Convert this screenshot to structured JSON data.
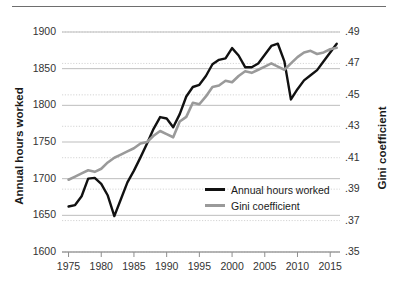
{
  "chart_data": {
    "type": "line",
    "title": "",
    "xlabel": "",
    "ylabel": "Annual hours worked",
    "y2label": "Gini coefficient",
    "x": [
      1975,
      1976,
      1977,
      1978,
      1979,
      1980,
      1981,
      1982,
      1983,
      1984,
      1985,
      1986,
      1987,
      1988,
      1989,
      1990,
      1991,
      1992,
      1993,
      1994,
      1995,
      1996,
      1997,
      1998,
      1999,
      2000,
      2001,
      2002,
      2003,
      2004,
      2005,
      2006,
      2007,
      2008,
      2009,
      2010,
      2011,
      2012,
      2013,
      2014,
      2015,
      2016
    ],
    "xlim": [
      1974,
      2016.5
    ],
    "xticks": [
      1975,
      1980,
      1985,
      1990,
      1995,
      2000,
      2005,
      2010,
      2015
    ],
    "xtick_labels": [
      "1975",
      "1980",
      "1985",
      "1990",
      "1995",
      "2000",
      "2005",
      "2010",
      "2015"
    ],
    "ylim": [
      1600,
      1900
    ],
    "yticks": [
      1600,
      1650,
      1700,
      1750,
      1800,
      1850,
      1900
    ],
    "ytick_labels": [
      "1600",
      "1650",
      "1700",
      "1750",
      "1800",
      "1850",
      "1900"
    ],
    "y2lim": [
      0.35,
      0.49
    ],
    "y2ticks": [
      0.35,
      0.37,
      0.39,
      0.41,
      0.43,
      0.45,
      0.47,
      0.49
    ],
    "y2tick_labels": [
      ".35",
      ".37",
      ".39",
      ".41",
      ".43",
      ".45",
      ".47",
      ".49"
    ],
    "grid": true,
    "legend_position": "center-right",
    "series": [
      {
        "name": "Annual hours worked",
        "axis": "left",
        "color": "#111111",
        "values": [
          1662,
          1664,
          1676,
          1700,
          1701,
          1693,
          1677,
          1649,
          1672,
          1695,
          1711,
          1729,
          1748,
          1768,
          1784,
          1782,
          1770,
          1788,
          1812,
          1825,
          1828,
          1840,
          1856,
          1862,
          1864,
          1878,
          1868,
          1852,
          1852,
          1857,
          1869,
          1881,
          1884,
          1860,
          1808,
          1822,
          1834,
          1841,
          1848,
          1860,
          1872,
          1884
        ]
      },
      {
        "name": "Gini coefficient",
        "axis": "right",
        "color": "#9a9a9a",
        "values": [
          0.396,
          0.398,
          0.4,
          0.402,
          0.401,
          0.403,
          0.407,
          0.41,
          0.412,
          0.414,
          0.416,
          0.419,
          0.42,
          0.424,
          0.427,
          0.425,
          0.423,
          0.433,
          0.436,
          0.445,
          0.444,
          0.449,
          0.455,
          0.456,
          0.459,
          0.458,
          0.462,
          0.465,
          0.464,
          0.466,
          0.468,
          0.47,
          0.468,
          0.466,
          0.47,
          0.474,
          0.477,
          0.478,
          0.476,
          0.477,
          0.479,
          0.48
        ]
      }
    ]
  },
  "axes": {
    "left_title": "Annual hours worked",
    "right_title": "Gini coefficient"
  },
  "legend": {
    "items": [
      {
        "label": "Annual hours worked",
        "color": "#111111"
      },
      {
        "label": "Gini coefficient",
        "color": "#9a9a9a"
      }
    ]
  }
}
